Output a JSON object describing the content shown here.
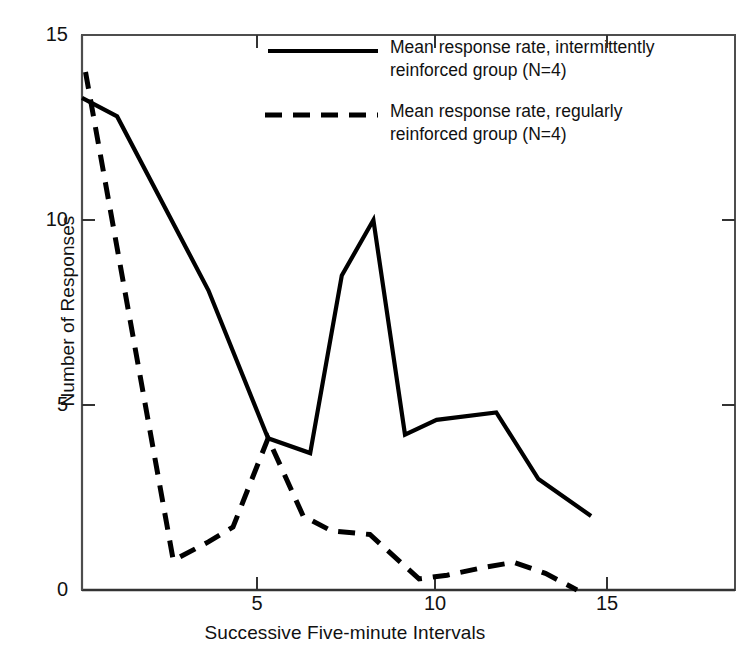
{
  "chart_data": {
    "type": "line",
    "title": "",
    "xlabel": "Successive Five-minute Intervals",
    "ylabel": "Number of Responses",
    "xlim": [
      0,
      18.6
    ],
    "ylim": [
      0,
      15
    ],
    "xticks": [
      5,
      10,
      15
    ],
    "yticks": [
      0,
      5,
      10,
      15
    ],
    "grid": false,
    "legend_position": "top-right",
    "series": [
      {
        "name": "Mean response rate, intermittently reinforced group (N=4)",
        "style": "solid",
        "color": "#000000",
        "x": [
          0.0,
          1.0,
          3.6,
          5.3,
          6.5,
          7.4,
          8.3,
          9.2,
          10.1,
          11.8,
          13.0,
          14.5
        ],
        "y": [
          13.3,
          12.8,
          8.1,
          4.1,
          3.7,
          8.5,
          10.0,
          4.2,
          4.6,
          4.8,
          3.0,
          2.0
        ]
      },
      {
        "name": "Mean response rate, regularly reinforced group (N=4)",
        "style": "dashed",
        "color": "#000000",
        "x": [
          0.1,
          2.6,
          3.6,
          4.3,
          5.3,
          6.3,
          7.1,
          8.2,
          9.6,
          10.4,
          11.4,
          12.3,
          13.2,
          14.1
        ],
        "y": [
          14.0,
          0.8,
          1.3,
          1.7,
          4.1,
          2.0,
          1.6,
          1.5,
          0.3,
          0.4,
          0.6,
          0.75,
          0.45,
          0.0
        ]
      }
    ]
  },
  "axes": {
    "y_title": "Number of Responses",
    "x_title": "Successive Five-minute Intervals",
    "y_tick_labels": [
      "0",
      "5",
      "10",
      "15"
    ],
    "x_tick_labels": [
      "5",
      "10",
      "15"
    ]
  },
  "legend": {
    "entries": [
      {
        "label": "Mean response rate, intermittently\nreinforced group (N=4)",
        "line_style": "solid"
      },
      {
        "label": "Mean response rate, regularly\nreinforced group (N=4)",
        "line_style": "dashed"
      }
    ]
  },
  "colors": {
    "ink": "#000000",
    "frame": "#555555",
    "background": "#ffffff"
  }
}
